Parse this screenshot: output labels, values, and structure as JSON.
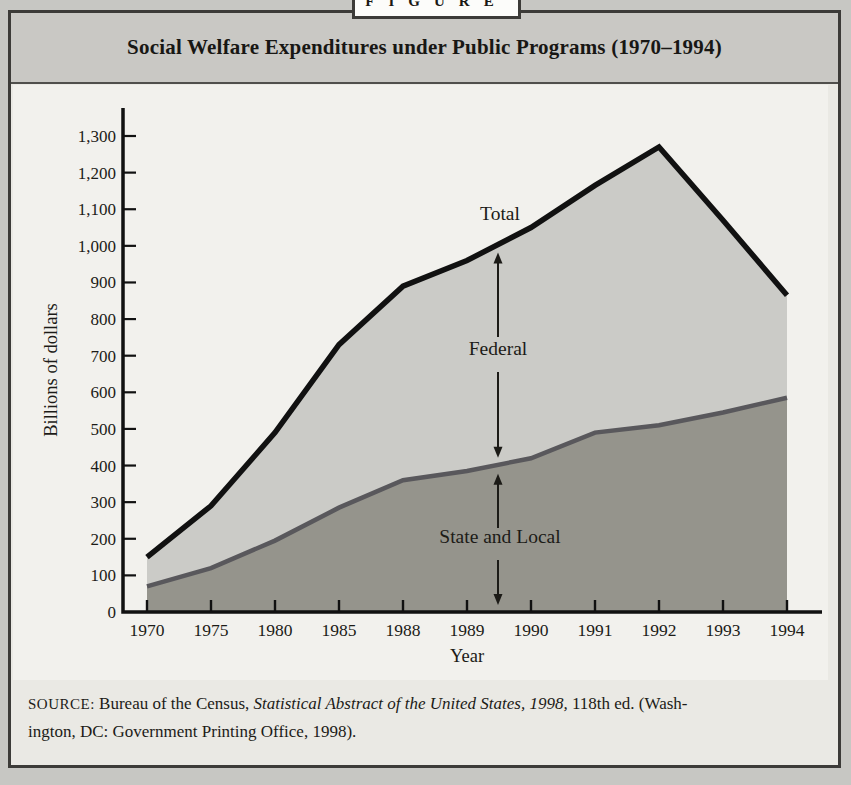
{
  "figure_tab": {
    "label": "FIGURE"
  },
  "header": {
    "title": "Social Welfare Expenditures under Public Programs (1970–1994)"
  },
  "chart_data": {
    "type": "area",
    "title": "Social Welfare Expenditures under Public Programs (1970–1994)",
    "xlabel": "Year",
    "ylabel": "Billions of dollars",
    "ylim": [
      0,
      1300
    ],
    "y_tick_labels": [
      "0",
      "100",
      "200",
      "300",
      "400",
      "500",
      "600",
      "700",
      "800",
      "900",
      "1,000",
      "1,100",
      "1,200",
      "1,300"
    ],
    "categories": [
      "1970",
      "1975",
      "1980",
      "1985",
      "1988",
      "1989",
      "1990",
      "1991",
      "1992",
      "1993",
      "1994"
    ],
    "series": [
      {
        "name": "Total",
        "kind": "line",
        "values": [
          150,
          290,
          490,
          730,
          890,
          960,
          1050,
          1165,
          1270,
          1070,
          865
        ]
      },
      {
        "name": "State and Local",
        "kind": "area",
        "values": [
          70,
          120,
          195,
          285,
          360,
          385,
          420,
          490,
          510,
          545,
          585
        ]
      },
      {
        "name": "Federal",
        "kind": "band",
        "note": "shaded region between the State and Local boundary and the Total line"
      }
    ],
    "annotations": [
      {
        "label": "Total"
      },
      {
        "label": "Federal"
      },
      {
        "label": "State and Local"
      }
    ],
    "legend": "in-plot labels with double-headed arrows",
    "grid": false,
    "colors": {
      "total_line": "#111111",
      "state_local_area": "#95948c",
      "state_local_line": "#59585c",
      "federal_area": "#cbcbc7",
      "plot_background": "#f2f1ed"
    }
  },
  "source_note": {
    "label": "SOURCE:",
    "text_regular_1": " Bureau of the Census, ",
    "text_italic": "Statistical Abstract of the United States, 1998,",
    "text_regular_2": " 118th ed. (Wash-",
    "line2": "ington, DC: Government Printing Office, 1998)."
  }
}
